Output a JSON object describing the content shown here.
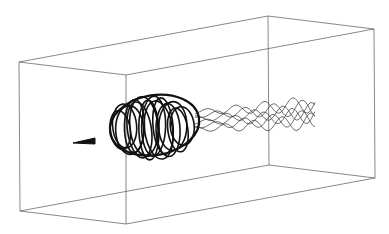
{
  "figure": {
    "type": "3d-streamline-visualization",
    "background": "#ffffff",
    "line_color": "#111111",
    "box_color": "#555555",
    "box": {
      "front": [
        [
          19,
          62
        ],
        [
          126,
          75
        ],
        [
          126,
          224
        ],
        [
          20,
          211
        ]
      ],
      "back": [
        [
          268,
          16
        ],
        [
          374,
          29
        ],
        [
          375,
          178
        ],
        [
          269,
          165
        ]
      ]
    },
    "vortex_core": {
      "center": [
        150,
        128
      ],
      "rx": 45,
      "ry": 30,
      "nose": [
        [
          73,
          143
        ],
        [
          95,
          138
        ]
      ],
      "loop_count": 14
    },
    "wake_tails": {
      "start_x": 195,
      "end_x": 315,
      "count": 6
    }
  }
}
